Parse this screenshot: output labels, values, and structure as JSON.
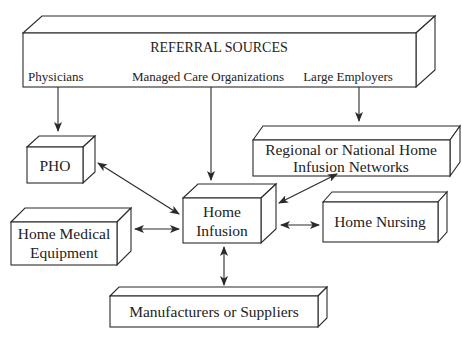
{
  "diagram": {
    "referral": {
      "title": "REFERRAL SOURCES",
      "sources": [
        "Physicians",
        "Managed Care Organizations",
        "Large Employers"
      ]
    },
    "nodes": {
      "pho": {
        "lines": [
          "PHO"
        ]
      },
      "regional": {
        "lines": [
          "Regional or National Home",
          "Infusion Networks"
        ]
      },
      "home_infusion": {
        "lines": [
          "Home",
          "Infusion"
        ]
      },
      "home_medical": {
        "lines": [
          "Home Medical",
          "Equipment"
        ]
      },
      "home_nursing": {
        "lines": [
          "Home Nursing"
        ]
      },
      "manufacturers": {
        "lines": [
          "Manufacturers or Suppliers"
        ]
      }
    },
    "edges": [
      {
        "from": "Physicians",
        "to": "PHO",
        "type": "directed"
      },
      {
        "from": "Managed Care Organizations",
        "to": "Home Infusion",
        "type": "directed"
      },
      {
        "from": "Large Employers",
        "to": "Regional or National Home Infusion Networks",
        "type": "directed"
      },
      {
        "from": "PHO",
        "to": "Home Infusion",
        "type": "bidirectional"
      },
      {
        "from": "Regional or National Home Infusion Networks",
        "to": "Home Infusion",
        "type": "bidirectional"
      },
      {
        "from": "Home Medical Equipment",
        "to": "Home Infusion",
        "type": "bidirectional"
      },
      {
        "from": "Home Nursing",
        "to": "Home Infusion",
        "type": "bidirectional"
      },
      {
        "from": "Manufacturers or Suppliers",
        "to": "Home Infusion",
        "type": "bidirectional"
      }
    ]
  }
}
